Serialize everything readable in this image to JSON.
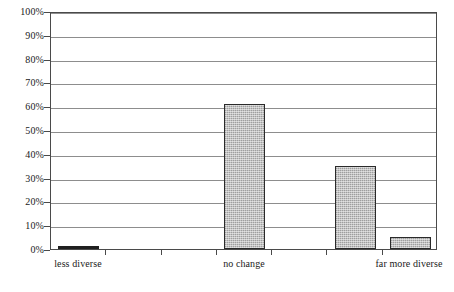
{
  "chart_data": {
    "type": "bar",
    "title": "",
    "subtitle": "",
    "xlabel": "",
    "ylabel": "",
    "ylim": [
      0,
      100
    ],
    "y_unit": "%",
    "grid": true,
    "legend": null,
    "legend_position": "none",
    "categories": [
      "less diverse",
      "",
      "",
      "no change",
      "",
      "",
      "far more diverse"
    ],
    "visible_tick_labels": [
      "less diverse",
      "no change",
      "far more diverse"
    ],
    "values": [
      1,
      0,
      0,
      61,
      0,
      35,
      5
    ],
    "bars": [
      {
        "category": "less diverse",
        "value": 1,
        "slot": 0
      },
      {
        "category": "no change",
        "value": 61,
        "slot": 3
      },
      {
        "category": "",
        "value": 35,
        "slot": 5
      },
      {
        "category": "far more diverse",
        "value": 5,
        "slot": 6
      }
    ],
    "y_ticks": [
      "0%",
      "10%",
      "20%",
      "30%",
      "40%",
      "50%",
      "60%",
      "70%",
      "80%",
      "90%",
      "100%"
    ],
    "y_tick_values": [
      0,
      10,
      20,
      30,
      40,
      50,
      60,
      70,
      80,
      90,
      100
    ],
    "colors": {
      "bar_fill": "#b4b4b4",
      "bar_border": "#2a2a2a",
      "sliver_fill": "#1f1f1f",
      "gridline": "#8d8d8d",
      "axis": "#4a4a4a",
      "background": "#ffffff",
      "text": "#1a1a1a"
    }
  }
}
